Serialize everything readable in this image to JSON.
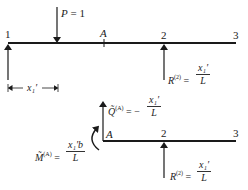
{
  "top_diagram": {
    "nodes": [
      {
        "label": "1",
        "x": 8
      },
      {
        "label": "A",
        "x": 104
      },
      {
        "label": "2",
        "x": 164
      },
      {
        "label": "3",
        "x": 236
      }
    ],
    "load": {
      "symbol": "P",
      "equals": "= 1"
    },
    "dimension": {
      "label": "x₁′"
    },
    "reaction": {
      "symbol": "R",
      "superscript": "(2)",
      "equals": "=",
      "numerator": "x₁′",
      "denominator": "L"
    }
  },
  "bottom_diagram": {
    "nodes": [
      {
        "label": "A",
        "x": 104
      },
      {
        "label": "2",
        "x": 164
      },
      {
        "label": "3",
        "x": 236
      }
    ],
    "shear": {
      "symbol": "Q̃",
      "superscript": "(A)",
      "equals": "= −",
      "numerator": "x₁′",
      "denominator": "L"
    },
    "moment": {
      "symbol": "M̃",
      "superscript": "(A)",
      "equals": "=",
      "numerator": "x₁′b",
      "denominator": "L"
    },
    "reaction": {
      "symbol": "R",
      "superscript": "(2)",
      "equals": "=",
      "numerator": "x₁′",
      "denominator": "L"
    }
  },
  "colors": {
    "line": "#1a1a1a",
    "background": "#ffffff"
  }
}
